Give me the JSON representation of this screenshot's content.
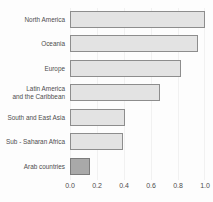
{
  "chart_data": {
    "type": "bar",
    "orientation": "horizontal",
    "title": "",
    "xlabel": "",
    "ylabel": "",
    "xlim": [
      0.0,
      1.0
    ],
    "grid": true,
    "legend": "none",
    "categories": [
      "North America",
      "Oceania",
      "Europe",
      "Latin America\nand the Caribbean",
      "South and East Asia",
      "Sub - Saharan Africa",
      "Arab countries"
    ],
    "values": [
      1.0,
      0.95,
      0.82,
      0.67,
      0.41,
      0.39,
      0.15
    ],
    "xticks": [
      "0.0",
      "0.2",
      "0.4",
      "0.6",
      "0.8",
      "1.0"
    ],
    "xtick_values": [
      0.0,
      0.2,
      0.4,
      0.6,
      0.8,
      1.0
    ],
    "bar_fill": "#e3e3e3",
    "bar_border": "#8d8d8d",
    "highlight_fill": "#a9a9a9",
    "highlight_border": "#7c7c7c",
    "highlight_index": 6,
    "background": "#fdfdfd",
    "gridline_color": "#f1f1f1"
  }
}
